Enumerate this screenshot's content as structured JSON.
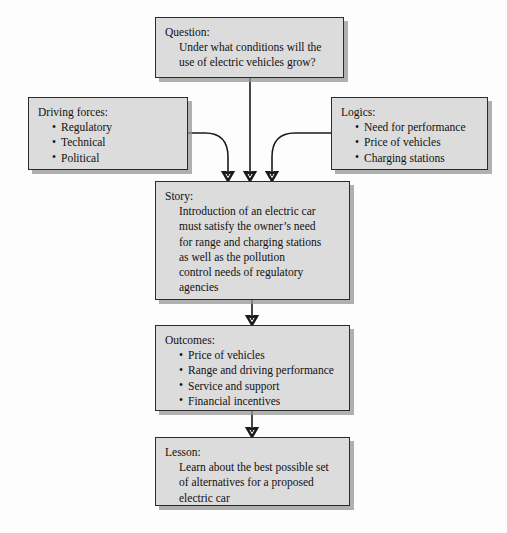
{
  "diagram": {
    "accent_fill": "#dcdcdc",
    "border_color": "#2b2b2b",
    "background": "#fdfdfd",
    "nodes": {
      "question": {
        "label": "Question:",
        "lines": [
          "Under what conditions will the",
          "use of electric vehicles grow?"
        ]
      },
      "driving_forces": {
        "label": "Driving forces:",
        "bullets": [
          "Regulatory",
          "Technical",
          "Political"
        ]
      },
      "logics": {
        "label": "Logics:",
        "bullets": [
          "Need for performance",
          "Price of vehicles",
          "Charging stations"
        ]
      },
      "story": {
        "label": "Story:",
        "lines": [
          "Introduction of an electric car",
          "must satisfy the owner’s need",
          "for range and charging stations",
          "as well as the pollution",
          "control needs of regulatory",
          "agencies"
        ]
      },
      "outcomes": {
        "label": "Outcomes:",
        "bullets": [
          "Price of vehicles",
          "Range and driving performance",
          "Service and support",
          "Financial incentives"
        ]
      },
      "lesson": {
        "label": "Lesson:",
        "lines": [
          "Learn about the best possible set",
          "of alternatives for a proposed",
          "electric car"
        ]
      }
    },
    "edges": [
      {
        "name": "question-to-story",
        "from": "question",
        "to": "story",
        "style": "straight-arrow"
      },
      {
        "name": "driving-forces-to-story",
        "from": "driving_forces",
        "to": "story",
        "style": "curved-arrow"
      },
      {
        "name": "logics-to-story",
        "from": "logics",
        "to": "story",
        "style": "curved-arrow"
      },
      {
        "name": "story-to-outcomes",
        "from": "story",
        "to": "outcomes",
        "style": "straight-arrow"
      },
      {
        "name": "outcomes-to-lesson",
        "from": "outcomes",
        "to": "lesson",
        "style": "straight-arrow"
      }
    ]
  }
}
